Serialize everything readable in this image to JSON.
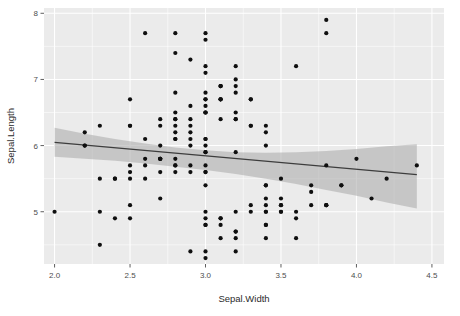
{
  "chart_data": {
    "type": "scatter",
    "title": "",
    "xlabel": "Sepal.Width",
    "ylabel": "Sepal.Length",
    "xlim": [
      1.93,
      4.58
    ],
    "ylim": [
      4.21,
      8.08
    ],
    "xticks": [
      "2.0",
      "2.5",
      "3.0",
      "3.5",
      "4.0",
      "4.5"
    ],
    "xtick_values": [
      2.0,
      2.5,
      3.0,
      3.5,
      4.0,
      4.5
    ],
    "yticks": [
      "5",
      "6",
      "7",
      "8"
    ],
    "ytick_values": [
      5,
      6,
      7,
      8
    ],
    "grid": true,
    "legend": "none",
    "point_color": "#0f0f0f",
    "panel_color": "#ebebeb",
    "grid_color": "#ffffff",
    "band_color": "#b0b0b0",
    "line_color": "#3d3d3d",
    "smooth": {
      "method": "lm",
      "x_start": 2.0,
      "x_end": 4.4,
      "y_start": 6.05,
      "y_end": 5.56,
      "ci_upper": [
        6.27,
        6.18,
        6.1,
        6.03,
        5.97,
        5.93,
        5.9,
        5.89,
        5.9,
        5.92,
        5.95,
        5.99,
        6.02
      ],
      "ci_lower": [
        5.83,
        5.8,
        5.77,
        5.73,
        5.68,
        5.63,
        5.57,
        5.5,
        5.42,
        5.33,
        5.24,
        5.14,
        5.05
      ],
      "ci_x": [
        2.0,
        2.2,
        2.4,
        2.6,
        2.8,
        3.0,
        3.2,
        3.4,
        3.6,
        3.8,
        4.0,
        4.2,
        4.4
      ]
    },
    "x": [
      3.5,
      3.0,
      3.2,
      3.1,
      3.6,
      3.9,
      3.4,
      3.4,
      2.9,
      3.1,
      3.7,
      3.4,
      3.0,
      3.0,
      4.0,
      4.4,
      3.9,
      3.5,
      3.8,
      3.8,
      3.4,
      3.7,
      3.6,
      3.3,
      3.4,
      3.0,
      3.4,
      3.5,
      3.4,
      3.2,
      3.1,
      3.4,
      4.1,
      4.2,
      3.1,
      3.2,
      3.5,
      3.6,
      3.0,
      3.4,
      3.5,
      2.3,
      3.2,
      3.5,
      3.8,
      3.0,
      3.8,
      3.2,
      3.7,
      3.3,
      3.2,
      3.2,
      3.1,
      2.3,
      2.8,
      2.8,
      3.3,
      2.4,
      2.9,
      2.7,
      2.0,
      3.0,
      2.2,
      2.9,
      2.9,
      3.1,
      3.0,
      2.7,
      2.2,
      2.5,
      3.2,
      2.8,
      2.5,
      2.8,
      2.9,
      3.0,
      2.8,
      3.0,
      2.9,
      2.6,
      2.4,
      2.4,
      2.7,
      2.7,
      3.0,
      3.4,
      3.1,
      2.3,
      3.0,
      2.5,
      2.6,
      3.0,
      2.6,
      2.3,
      2.7,
      3.0,
      2.9,
      2.9,
      2.5,
      2.8,
      3.3,
      2.7,
      3.0,
      2.9,
      3.0,
      3.0,
      2.5,
      2.9,
      2.5,
      3.6,
      3.2,
      2.7,
      3.0,
      2.5,
      2.8,
      3.2,
      3.0,
      3.8,
      2.6,
      2.2,
      3.2,
      2.8,
      2.8,
      2.7,
      3.3,
      3.2,
      2.8,
      3.0,
      2.8,
      3.0,
      2.8,
      3.8,
      2.8,
      2.8,
      2.6,
      3.0,
      3.4,
      3.1,
      3.0,
      3.1,
      3.1,
      3.1,
      2.7,
      3.2,
      3.3,
      3.0,
      2.5,
      3.0,
      3.4,
      3.0
    ],
    "y": [
      5.1,
      4.9,
      4.7,
      4.6,
      5.0,
      5.4,
      4.6,
      5.0,
      4.4,
      4.9,
      5.4,
      4.8,
      4.8,
      4.3,
      5.8,
      5.7,
      5.4,
      5.1,
      5.7,
      5.1,
      5.4,
      5.1,
      4.6,
      5.1,
      4.8,
      5.0,
      5.0,
      5.2,
      5.2,
      4.7,
      4.8,
      5.4,
      5.2,
      5.5,
      4.9,
      5.0,
      5.5,
      4.9,
      4.4,
      5.1,
      5.0,
      4.5,
      4.4,
      5.0,
      5.1,
      4.8,
      5.1,
      4.6,
      5.3,
      5.0,
      7.0,
      6.4,
      6.9,
      5.5,
      6.5,
      5.7,
      6.3,
      4.9,
      6.6,
      5.2,
      5.0,
      5.9,
      6.0,
      6.1,
      5.6,
      6.7,
      5.6,
      5.8,
      6.2,
      5.6,
      5.9,
      6.1,
      6.3,
      6.1,
      6.4,
      6.6,
      6.8,
      6.7,
      6.0,
      5.7,
      5.5,
      5.5,
      5.8,
      6.0,
      5.4,
      6.0,
      6.7,
      6.3,
      5.6,
      5.5,
      5.5,
      6.1,
      5.8,
      5.0,
      5.6,
      5.7,
      5.7,
      6.2,
      5.1,
      5.7,
      6.3,
      5.8,
      7.1,
      6.3,
      6.5,
      7.6,
      4.9,
      7.3,
      6.7,
      7.2,
      6.5,
      6.4,
      6.8,
      5.7,
      5.8,
      6.4,
      6.5,
      7.7,
      7.7,
      6.0,
      6.9,
      5.6,
      7.7,
      6.3,
      6.7,
      7.2,
      6.2,
      6.1,
      6.4,
      7.2,
      7.4,
      7.9,
      6.4,
      6.3,
      6.1,
      7.7,
      6.3,
      6.4,
      6.0,
      6.9,
      6.7,
      6.9,
      5.8,
      6.8,
      6.7,
      6.7,
      6.3,
      6.5,
      6.2,
      5.9
    ]
  }
}
